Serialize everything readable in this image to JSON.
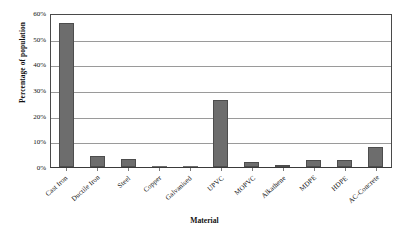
{
  "chart_data": {
    "type": "bar",
    "title": "",
    "xlabel": "Material",
    "ylabel": "Percentage of population",
    "categories": [
      "Cast Iron",
      "Ductile Iron",
      "Steel",
      "Copper",
      "Galvanised",
      "UPVC",
      "MOPVC",
      "Alkathene",
      "MDPE",
      "HDPE",
      "AC-Concrete"
    ],
    "values": [
      56,
      4.2,
      3.0,
      0.2,
      0.1,
      26,
      2.0,
      0.6,
      2.8,
      2.6,
      7.8
    ],
    "ylim": [
      0,
      60
    ],
    "ytick_values": [
      0,
      10,
      20,
      30,
      40,
      50,
      60
    ],
    "ytick_labels": [
      "0%",
      "10%",
      "20%",
      "30%",
      "40%",
      "50%",
      "60%"
    ],
    "grid": true,
    "grid_axis": "y",
    "legend": false,
    "bar_color": "#6d6d6d",
    "bar_edge_color": "#4d4d4d",
    "axis_color": "#4a4a4a",
    "gridline_color": "#9a9a9a",
    "background_color": "#ffffff",
    "xlabel_rotation_deg": -42
  }
}
